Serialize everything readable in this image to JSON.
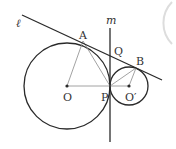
{
  "diagram": {
    "colors": {
      "stroke": "#2a2a2a",
      "thin": "#8a8a8a",
      "label": "#333333",
      "faint_arc": "#dddddd"
    },
    "labels": {
      "line_l": "ℓ",
      "line_m": "m",
      "A": "A",
      "B": "B",
      "Q": "Q",
      "O": "O",
      "P": "P",
      "O_prime": "O′"
    },
    "points": {
      "O": [
        67,
        86
      ],
      "O_prime": [
        129,
        86
      ],
      "P": [
        110,
        86
      ],
      "A": [
        83,
        41
      ],
      "B": [
        136,
        68
      ],
      "Q": [
        110,
        56
      ]
    },
    "circles": [
      {
        "name": "circle-O",
        "center": "O",
        "radius": 43
      },
      {
        "name": "circle-O-prime",
        "center": "O_prime",
        "radius": 19
      }
    ],
    "lines": [
      {
        "name": "line-l",
        "from": [
          22,
          15
        ],
        "to": [
          162,
          80
        ],
        "desc": "common external tangent through A and B"
      },
      {
        "name": "line-m",
        "from": [
          110,
          28
        ],
        "to": [
          110,
          142
        ],
        "desc": "common internal tangent at P"
      }
    ],
    "segments": [
      "OA",
      "AP",
      "OP",
      "PO′",
      "PB",
      "O′B"
    ]
  }
}
